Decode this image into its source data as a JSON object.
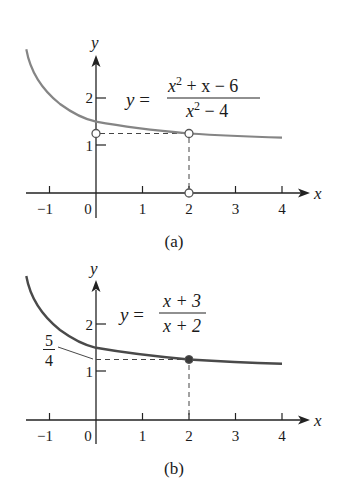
{
  "figure": {
    "panels": [
      {
        "id": "a",
        "caption": "(a)",
        "equation": {
          "lhs": "y =",
          "numerator": "x² + x − 6",
          "numerator_base": "x",
          "numerator_exp": "2",
          "numerator_rest": " + x − 6",
          "denominator_base": "x",
          "denominator_exp": "2",
          "denominator_rest": " − 4"
        },
        "axis_labels": {
          "x": "x",
          "y": "y"
        },
        "x_ticks": [
          "−1",
          "0",
          "1",
          "2",
          "3",
          "4"
        ],
        "y_ticks": [
          "1",
          "2"
        ],
        "curve_color": "#858585",
        "markers": [
          {
            "type": "open-circle",
            "x": 0,
            "y": 1.25
          },
          {
            "type": "open-circle",
            "x": 2,
            "y": 1.25
          },
          {
            "type": "open-circle",
            "x": 2,
            "y": 0
          }
        ]
      },
      {
        "id": "b",
        "caption": "(b)",
        "equation": {
          "lhs": "y =",
          "numerator": "x + 3",
          "denominator": "x + 2"
        },
        "axis_labels": {
          "x": "x",
          "y": "y"
        },
        "x_ticks": [
          "−1",
          "0",
          "1",
          "2",
          "3",
          "4"
        ],
        "y_ticks": [
          "1",
          "2"
        ],
        "annotation": {
          "numerator": "5",
          "denominator": "4"
        },
        "curve_color": "#4a4a4a",
        "markers": [
          {
            "type": "filled-circle",
            "x": 2,
            "y": 1.25
          }
        ]
      }
    ]
  }
}
